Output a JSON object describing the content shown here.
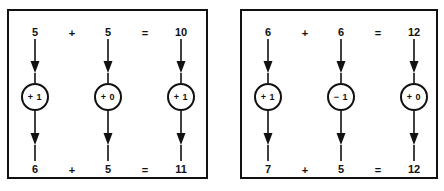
{
  "figure": {
    "type": "diagram",
    "colors": {
      "background": "#ffffff",
      "stroke": "#111111",
      "text": "#111111"
    },
    "panels": [
      {
        "id": "panel-left",
        "top_row": {
          "operand1": "5",
          "operator1": "+",
          "operand2": "5",
          "operator2": "=",
          "result": "10"
        },
        "nodes": [
          {
            "label": "+ 1"
          },
          {
            "label": "+ 0"
          },
          {
            "label": "+ 1"
          }
        ],
        "bottom_row": {
          "operand1": "6",
          "operator1": "+",
          "operand2": "5",
          "operator2": "=",
          "result": "11"
        }
      },
      {
        "id": "panel-right",
        "top_row": {
          "operand1": "6",
          "operator1": "+",
          "operand2": "6",
          "operator2": "=",
          "result": "12"
        },
        "nodes": [
          {
            "label": "+ 1"
          },
          {
            "label": "− 1"
          },
          {
            "label": "+ 0"
          }
        ],
        "bottom_row": {
          "operand1": "7",
          "operator1": "+",
          "operand2": "5",
          "operator2": "=",
          "result": "12"
        }
      }
    ]
  }
}
